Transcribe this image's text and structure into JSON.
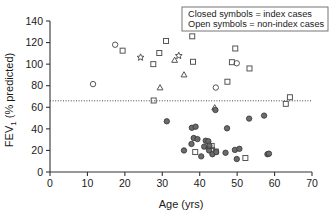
{
  "chart_data": {
    "type": "scatter",
    "title": "",
    "xlabel": "Age (yrs)",
    "ylabel": "FEV₁ (% predicted)",
    "ylabel_main": "FEV",
    "ylabel_sub": "1",
    "ylabel_rest": " (% predicted)",
    "xlim": [
      0,
      70
    ],
    "ylim": [
      0,
      140
    ],
    "xticks": [
      0,
      10,
      20,
      30,
      40,
      50,
      60,
      70
    ],
    "yticks": [
      0,
      20,
      40,
      60,
      80,
      100,
      120,
      140
    ],
    "xtick_labels": [
      "0",
      "10",
      "20",
      "30",
      "40",
      "50",
      "60",
      "70"
    ],
    "ytick_labels": [
      "0",
      "20",
      "40",
      "60",
      "80",
      "100",
      "120",
      "140"
    ],
    "grid": false,
    "reference_line": {
      "y": 66,
      "style": "dotted",
      "label": ""
    },
    "legend": {
      "position": "top-right",
      "entries": [
        "Closed symbols = index cases",
        "Open symbols = non-index cases"
      ]
    },
    "colors": {
      "open_stroke": "#4d4d4d",
      "closed_fill": "#6b6b6b",
      "axis": "#333333",
      "text": "#1a1a1a",
      "background": "#ffffff"
    },
    "series": [
      {
        "name": "non-index cases (open circle)",
        "marker": "circle",
        "fill": "open",
        "points": [
          [
            11.5,
            81.5
          ],
          [
            17.4,
            118.0
          ],
          [
            44.3,
            78.3
          ],
          [
            49.9,
            100.8
          ]
        ]
      },
      {
        "name": "non-index cases (open square)",
        "marker": "square",
        "fill": "open",
        "points": [
          [
            19.4,
            112.5
          ],
          [
            27.6,
            100.0
          ],
          [
            29.2,
            110.3
          ],
          [
            31.0,
            121.5
          ],
          [
            38.0,
            125.8
          ],
          [
            38.2,
            102.2
          ],
          [
            27.7,
            66.3
          ],
          [
            38.8,
            18.5
          ],
          [
            43.3,
            20.5
          ],
          [
            43.2,
            24.2
          ],
          [
            44.3,
            19.0
          ],
          [
            47.4,
            83.7
          ],
          [
            48.6,
            101.8
          ],
          [
            49.5,
            114.5
          ],
          [
            52.2,
            13.0
          ],
          [
            53.3,
            96.0
          ],
          [
            63.0,
            63.2
          ],
          [
            64.1,
            69.3
          ]
        ]
      },
      {
        "name": "non-index cases (open triangle)",
        "marker": "triangle",
        "fill": "open",
        "points": [
          [
            29.4,
            78.0
          ],
          [
            33.3,
            103.5
          ],
          [
            35.8,
            90.0
          ],
          [
            44.0,
            59.5
          ]
        ]
      },
      {
        "name": "non-index cases (open star)",
        "marker": "star",
        "fill": "open",
        "points": [
          [
            24.2,
            106.2
          ],
          [
            34.4,
            107.8
          ]
        ]
      },
      {
        "name": "index cases (closed circle)",
        "marker": "circle",
        "fill": "closed",
        "points": [
          [
            31.2,
            47.0
          ],
          [
            35.8,
            20.0
          ],
          [
            37.8,
            26.0
          ],
          [
            37.9,
            41.0
          ],
          [
            38.4,
            31.5
          ],
          [
            38.9,
            42.0
          ],
          [
            39.4,
            30.5
          ],
          [
            40.4,
            14.5
          ],
          [
            41.2,
            23.5
          ],
          [
            41.6,
            29.0
          ],
          [
            42.3,
            28.5
          ],
          [
            42.4,
            22.5
          ],
          [
            42.5,
            20.0
          ],
          [
            42.6,
            24.5
          ],
          [
            43.4,
            16.5
          ],
          [
            44.4,
            18.5
          ],
          [
            44.2,
            57.5
          ],
          [
            46.9,
            17.8
          ],
          [
            47.3,
            40.5
          ],
          [
            49.4,
            20.5
          ],
          [
            49.9,
            12.0
          ],
          [
            50.6,
            21.5
          ],
          [
            53.2,
            49.5
          ],
          [
            57.2,
            52.3
          ],
          [
            58.1,
            16.5
          ],
          [
            58.5,
            17.0
          ]
        ]
      }
    ]
  },
  "axes": {
    "x_title": "Age (yrs)",
    "y_title_prefix": "FEV",
    "y_title_sub": "1",
    "y_title_suffix": " (% predicted)"
  },
  "legend_box": {
    "line1": "Closed symbols = index cases",
    "line2": "Open symbols = non-index cases"
  }
}
